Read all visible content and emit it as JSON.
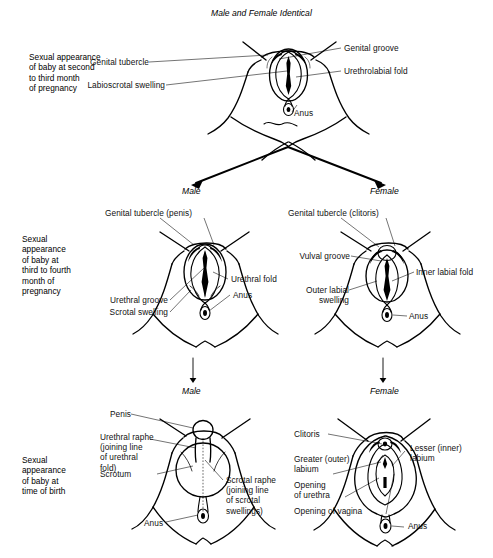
{
  "figure": {
    "title": "Male and Female Identical",
    "branch_labels": {
      "male_mid": "Male",
      "female_mid": "Female",
      "male_bottom": "Male",
      "female_bottom": "Female"
    }
  },
  "stages": [
    {
      "id": "stage-1",
      "caption": "Sexual appearance\nof baby at second\nto third month\nof pregnancy",
      "diagram": "undifferentiated-genitalia",
      "labels": [
        {
          "name": "genital-tubercle",
          "text": "Genital tubercle"
        },
        {
          "name": "labioscrotal-swelling",
          "text": "Labioscrotal swelling"
        },
        {
          "name": "genital-groove",
          "text": "Genital groove"
        },
        {
          "name": "urethrolabial-fold",
          "text": "Urethrolabial fold"
        },
        {
          "name": "anus",
          "text": "Anus"
        }
      ]
    },
    {
      "id": "stage-2",
      "caption": "Sexual\nappearance\nof baby at\nthird to fourth\nmonth of\npregnancy",
      "male": {
        "diagram": "male-third-to-fourth-month",
        "labels": [
          {
            "name": "genital-tubercle-penis",
            "text": "Genital tubercle (penis)"
          },
          {
            "name": "urethral-fold",
            "text": "Urethral fold"
          },
          {
            "name": "urethral-groove",
            "text": "Urethral groove"
          },
          {
            "name": "scrotal-swelling",
            "text": "Scrotal swelling"
          },
          {
            "name": "anus",
            "text": "Anus"
          }
        ]
      },
      "female": {
        "diagram": "female-third-to-fourth-month",
        "labels": [
          {
            "name": "genital-tubercle-clitoris",
            "text": "Genital tubercle (clitoris)"
          },
          {
            "name": "vulval-groove",
            "text": "Vulval groove"
          },
          {
            "name": "inner-labial-fold",
            "text": "Inner labial fold"
          },
          {
            "name": "outer-labial-swelling",
            "text": "Outer labial\nswelling"
          },
          {
            "name": "anus",
            "text": "Anus"
          }
        ]
      }
    },
    {
      "id": "stage-3",
      "caption": "Sexual\nappearance\nof baby at\ntime of birth",
      "male": {
        "diagram": "male-at-birth",
        "labels": [
          {
            "name": "penis",
            "text": "Penis"
          },
          {
            "name": "urethral-raphe",
            "text": "Urethral raphe\n(joining line\nof urethral\nfold)"
          },
          {
            "name": "scrotum",
            "text": "Scrotum"
          },
          {
            "name": "scrotal-raphe",
            "text": "Scrotal raphe\n(joining line\nof scrotal\nswellings)"
          },
          {
            "name": "anus",
            "text": "Anus"
          }
        ]
      },
      "female": {
        "diagram": "female-at-birth",
        "labels": [
          {
            "name": "clitoris",
            "text": "Clitoris"
          },
          {
            "name": "greater-outer-labium",
            "text": "Greater (outer)\nlabium"
          },
          {
            "name": "opening-of-urethra",
            "text": "Opening\nof urethra"
          },
          {
            "name": "opening-of-vagina",
            "text": "Opening of vagina"
          },
          {
            "name": "lesser-inner-labium",
            "text": "Lesser (inner)\nlabium"
          },
          {
            "name": "anus",
            "text": "Anus"
          }
        ]
      }
    }
  ],
  "colors": {
    "ink": "#000000",
    "paper": "#ffffff"
  }
}
